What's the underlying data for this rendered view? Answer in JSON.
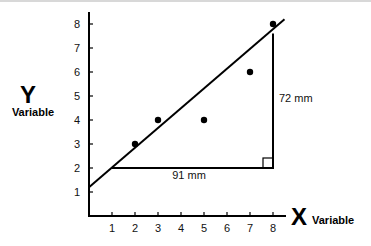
{
  "chart_data": {
    "type": "scatter",
    "title": "",
    "xlabel": "X Variable",
    "ylabel": "Y Variable",
    "xlabel_main": "X",
    "xlabel_sub": "Variable",
    "ylabel_main": "Y",
    "ylabel_sub": "Variable",
    "x_ticks": [
      1,
      2,
      3,
      4,
      5,
      6,
      7,
      8
    ],
    "y_ticks": [
      1,
      2,
      3,
      4,
      5,
      6,
      7,
      8
    ],
    "xlim": [
      0,
      8.6
    ],
    "ylim": [
      0,
      8.5
    ],
    "grid": false,
    "points": [
      {
        "x": 2,
        "y": 3
      },
      {
        "x": 3,
        "y": 4
      },
      {
        "x": 5,
        "y": 4
      },
      {
        "x": 7,
        "y": 6
      },
      {
        "x": 8,
        "y": 8
      }
    ],
    "trend_line": {
      "x1": 0,
      "y1": 1.2,
      "x2": 8.5,
      "y2": 8.2
    },
    "slope_triangle": {
      "run_from": {
        "x": 1,
        "y": 2
      },
      "corner": {
        "x": 8,
        "y": 2
      },
      "rise_to": {
        "x": 8,
        "y": 7.6
      },
      "run_label": "91 mm",
      "rise_label": "72 mm",
      "right_angle_marker": true
    }
  }
}
